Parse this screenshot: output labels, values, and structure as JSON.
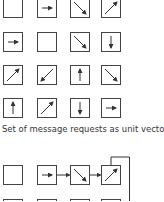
{
  "caption": "Set of message requests as unit vectors",
  "top_grid": [
    [
      "empty",
      "right",
      "down-right",
      "up-right"
    ],
    [
      "right",
      "empty",
      "down-right",
      "down"
    ],
    [
      "up-right",
      "down-left",
      "up",
      "down-right"
    ],
    [
      "up",
      "up-right",
      "down",
      "right"
    ]
  ],
  "bottom_grid": [
    [
      "empty",
      "right",
      "down-right",
      "up-right"
    ],
    [
      "empty",
      "empty",
      "empty",
      "empty"
    ]
  ],
  "colors": {
    "stroke": "#444444",
    "background": "#ffffff"
  }
}
